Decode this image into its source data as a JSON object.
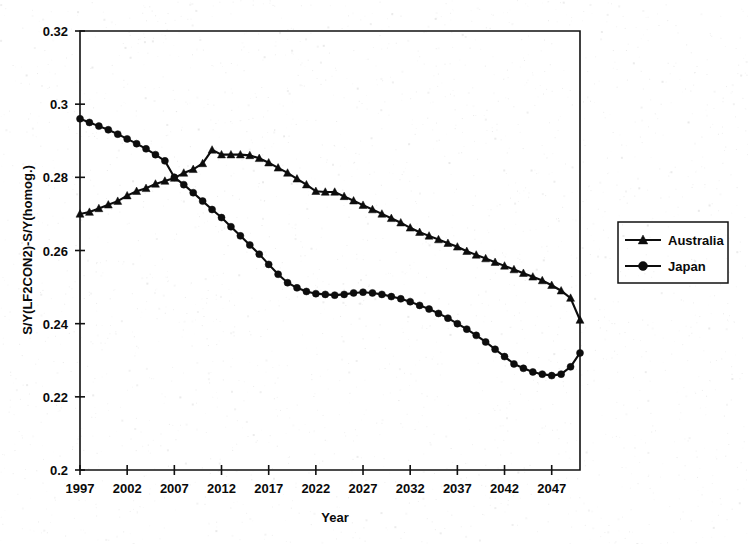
{
  "chart_data": {
    "type": "line",
    "title": "",
    "xlabel": "Year",
    "ylabel": "S/Y(LF2CON2)-S/Y(homog.)",
    "xlim": [
      1997,
      2050
    ],
    "ylim": [
      0.2,
      0.32
    ],
    "xticks": [
      1997,
      2002,
      2007,
      2012,
      2017,
      2022,
      2027,
      2032,
      2037,
      2042,
      2047
    ],
    "xtick_labels": [
      "1997",
      "2002",
      "2007",
      "2012",
      "2017",
      "2022",
      "2027",
      "2032",
      "2037",
      "2042",
      "2047"
    ],
    "yticks": [
      0.2,
      0.22,
      0.24,
      0.26,
      0.28,
      0.3,
      0.32
    ],
    "ytick_labels": [
      "0.2",
      "0.22",
      "0.24",
      "0.26",
      "0.28",
      "0.3",
      "0.32"
    ],
    "grid": false,
    "legend_position": "right-outside",
    "x": [
      1997,
      1998,
      1999,
      2000,
      2001,
      2002,
      2003,
      2004,
      2005,
      2006,
      2007,
      2008,
      2009,
      2010,
      2011,
      2012,
      2013,
      2014,
      2015,
      2016,
      2017,
      2018,
      2019,
      2020,
      2021,
      2022,
      2023,
      2024,
      2025,
      2026,
      2027,
      2028,
      2029,
      2030,
      2031,
      2032,
      2033,
      2034,
      2035,
      2036,
      2037,
      2038,
      2039,
      2040,
      2041,
      2042,
      2043,
      2044,
      2045,
      2046,
      2047,
      2048,
      2049,
      2050
    ],
    "series": [
      {
        "name": "Australia",
        "marker": "triangle",
        "values": [
          0.27,
          0.2705,
          0.2715,
          0.2725,
          0.2735,
          0.275,
          0.2762,
          0.277,
          0.2782,
          0.279,
          0.2798,
          0.2812,
          0.2822,
          0.2838,
          0.2875,
          0.2862,
          0.2862,
          0.2862,
          0.286,
          0.2852,
          0.284,
          0.2826,
          0.2812,
          0.2796,
          0.278,
          0.2762,
          0.276,
          0.276,
          0.2748,
          0.2736,
          0.2724,
          0.2712,
          0.27,
          0.2688,
          0.2676,
          0.2662,
          0.265,
          0.264,
          0.263,
          0.262,
          0.261,
          0.2598,
          0.2588,
          0.2578,
          0.2568,
          0.2558,
          0.2548,
          0.2538,
          0.2528,
          0.2518,
          0.2505,
          0.249,
          0.247,
          0.241
        ]
      },
      {
        "name": "Japan",
        "marker": "circle",
        "values": [
          0.296,
          0.295,
          0.294,
          0.293,
          0.2918,
          0.2905,
          0.2892,
          0.2878,
          0.2862,
          0.2845,
          0.28,
          0.278,
          0.2758,
          0.2735,
          0.2712,
          0.269,
          0.2665,
          0.264,
          0.2615,
          0.259,
          0.2562,
          0.2535,
          0.2512,
          0.2498,
          0.2488,
          0.2482,
          0.248,
          0.2478,
          0.248,
          0.2484,
          0.2486,
          0.2484,
          0.248,
          0.2474,
          0.2468,
          0.246,
          0.245,
          0.244,
          0.2428,
          0.2415,
          0.24,
          0.2385,
          0.2368,
          0.235,
          0.233,
          0.231,
          0.229,
          0.2278,
          0.2268,
          0.2262,
          0.2258,
          0.2262,
          0.2282,
          0.232
        ]
      }
    ]
  },
  "legend": {
    "entries": [
      {
        "label": "Australia",
        "marker": "triangle-marker"
      },
      {
        "label": "Japan",
        "marker": "circle-marker"
      }
    ]
  }
}
